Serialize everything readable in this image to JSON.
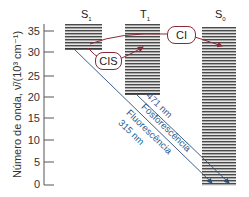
{
  "diagram": {
    "type": "jablonski-energy-diagram",
    "y_axis": {
      "label": "Número de onda, ν̄/(10³ cm⁻¹)",
      "ticks": [
        "35",
        "30",
        "25",
        "20",
        "15",
        "10",
        "5",
        "0"
      ]
    },
    "states": [
      {
        "id": "S1",
        "symbol": "S",
        "subscript": "1"
      },
      {
        "id": "T1",
        "symbol": "T",
        "subscript": "1"
      },
      {
        "id": "S0",
        "symbol": "S",
        "subscript": "0"
      }
    ],
    "transitions": {
      "cis": "CIS",
      "ci": "CI",
      "phosphorescence_wavelength": "471 nm",
      "phosphorescence_label": "Fosforescência",
      "fluorescence_label": "Fluorescência",
      "fluorescence_wavelength": "315 nm"
    },
    "colors": {
      "arrow_red": "#8a2a3a",
      "arrow_blue": "#2a4d7a",
      "text_blue": "#2a5d8f",
      "level_lines": "#555555"
    }
  }
}
